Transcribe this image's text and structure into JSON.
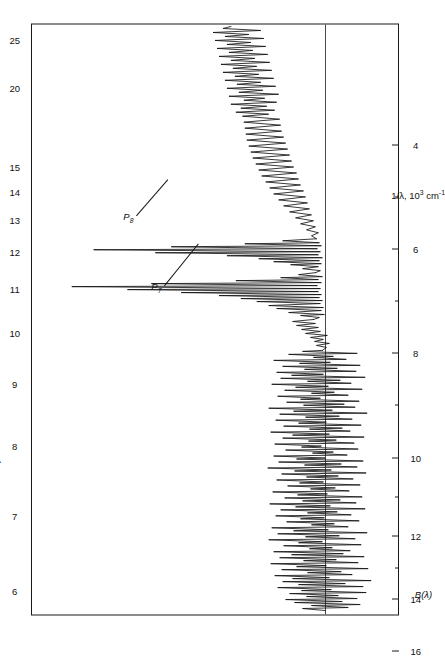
{
  "figure": {
    "caption_label": "B(λ)",
    "orientation_note": "rotated"
  },
  "axes": {
    "top": {
      "title": "λ, 10",
      "title_exp": "3",
      "title_unit": " Å",
      "ticks": [
        {
          "value": "6",
          "pos": 4.0
        },
        {
          "value": "7",
          "pos": 16.8
        },
        {
          "value": "8",
          "pos": 28.6
        },
        {
          "value": "9",
          "pos": 39.1
        },
        {
          "value": "10",
          "pos": 47.6
        },
        {
          "value": "11",
          "pos": 55.0
        },
        {
          "value": "12",
          "pos": 61.3
        },
        {
          "value": "13",
          "pos": 66.7
        },
        {
          "value": "14",
          "pos": 71.5
        },
        {
          "value": "15",
          "pos": 75.6
        },
        {
          "value": "20",
          "pos": 89.1
        },
        {
          "value": "25",
          "pos": 97.1
        }
      ]
    },
    "bottom": {
      "title": "1/λ, 10",
      "title_exp": "3",
      "title_unit": " cm",
      "title_unit_exp": "-1",
      "ticks": [
        {
          "value": "4",
          "pos": 79.4,
          "minor": false
        },
        {
          "value": "",
          "pos": 70.6,
          "minor": true
        },
        {
          "value": "6",
          "pos": 61.8,
          "minor": false
        },
        {
          "value": "",
          "pos": 53.0,
          "minor": true
        },
        {
          "value": "8",
          "pos": 44.2,
          "minor": false
        },
        {
          "value": "",
          "pos": 35.4,
          "minor": true
        },
        {
          "value": "10",
          "pos": 26.6,
          "minor": false
        },
        {
          "value": "",
          "pos": 20.0,
          "minor": true
        },
        {
          "value": "12",
          "pos": 13.3,
          "minor": false
        },
        {
          "value": "",
          "pos": 8.0,
          "minor": true
        },
        {
          "value": "14",
          "pos": 2.7,
          "minor": false
        }
      ],
      "extra_ticks": [
        {
          "value": "16",
          "pos": -6.0,
          "minor": false
        }
      ]
    }
  },
  "annotations": [
    {
      "id": "P7",
      "symbol": "P",
      "subscript": "7",
      "x": 59.0,
      "y": 35.0,
      "leader_len": 46,
      "leader_angle": 62
    },
    {
      "id": "P8",
      "symbol": "P",
      "subscript": "8",
      "x": 46.5,
      "y": 24.0,
      "leader_len": 40,
      "leader_angle": 58
    }
  ],
  "chart_data": {
    "type": "line",
    "title": "",
    "subtitle": "",
    "xlabel": "λ, 10³ Å  /  1/λ, 10³ cm⁻¹",
    "ylabel": "B(λ)",
    "xlim_lambda": [
      6,
      27
    ],
    "xlim_wavenumber": [
      3.2,
      16.8
    ],
    "ylim": [
      -1.0,
      1.0
    ],
    "grid": false,
    "legend": "none",
    "baseline_y": 0,
    "tick_labels_lambda": [
      "6",
      "7",
      "8",
      "9",
      "10",
      "11",
      "12",
      "13",
      "14",
      "15",
      "20",
      "25"
    ],
    "tick_labels_wavenumber": [
      "4",
      "6",
      "8",
      "10",
      "12",
      "14",
      "16"
    ],
    "annotation_labels": [
      "P₇",
      "P₈"
    ],
    "series": [
      {
        "name": "B(λ) spectrum",
        "description": "noisy continuum with strong narrow emission peaks near 1/λ = 6.5-7.5",
        "x": [
          3.3,
          3.5,
          3.7,
          3.9,
          4.1,
          4.3,
          4.5,
          4.7,
          4.9,
          5.1,
          5.3,
          5.5,
          5.7,
          5.9,
          6.1,
          6.3,
          6.5,
          6.7,
          6.9,
          7.1,
          7.3,
          7.5,
          7.7,
          7.9,
          8.1,
          8.4,
          8.7,
          9.0,
          9.4,
          9.8,
          10.2,
          10.6,
          11.0,
          11.5,
          12.0,
          12.5,
          13.0,
          13.5,
          14.0,
          14.5,
          15.0,
          15.5,
          16.0,
          16.5
        ],
        "values": [
          0.02,
          -0.05,
          0.08,
          -0.1,
          0.06,
          -0.07,
          0.12,
          -0.09,
          0.05,
          -0.12,
          0.09,
          -0.06,
          0.14,
          -0.08,
          0.07,
          -0.05,
          0.23,
          0.95,
          0.4,
          0.88,
          0.52,
          0.18,
          0.07,
          0.1,
          0.14,
          0.17,
          0.21,
          0.26,
          0.3,
          0.33,
          0.3,
          0.27,
          0.24,
          0.21,
          0.18,
          0.16,
          0.14,
          0.12,
          0.1,
          0.09,
          0.08,
          0.07,
          0.06,
          0.05
        ]
      }
    ],
    "peaks": [
      {
        "label": "P₇",
        "wavenumber": 7.05,
        "lambda": 14.2,
        "relative_height": 0.36
      },
      {
        "label": "P₈",
        "wavenumber": 8.55,
        "lambda": 11.7,
        "relative_height": 0.22
      }
    ]
  }
}
